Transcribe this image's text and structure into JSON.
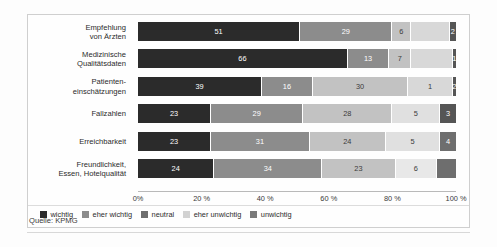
{
  "cropped_heading": "",
  "source": "Quelle: KPMG",
  "axis": {
    "ticks": [
      "0%",
      "20 %",
      "40 %",
      "60 %",
      "80 %",
      "100 %"
    ]
  },
  "legend": {
    "items": [
      {
        "label": "wichtig",
        "color": "#2b2b2b"
      },
      {
        "label": "eher wichtig",
        "color": "#8c8c8c"
      },
      {
        "label": "neutral",
        "color": "#6e6e6e"
      },
      {
        "label": "eher unwichtig",
        "color": "#d2d2d2"
      },
      {
        "label": "unwichtig",
        "color": "#7a7a7a"
      }
    ]
  },
  "chart_data": {
    "type": "bar",
    "orientation": "horizontal",
    "stacked": true,
    "normalized_percent": true,
    "title": "",
    "xlabel": "",
    "ylabel": "",
    "xlim": [
      0,
      100
    ],
    "grid": false,
    "legend_position": "bottom-left",
    "categories": [
      [
        "Empfehlung",
        "von Ärzten"
      ],
      [
        "Medizinische",
        "Qualitätsdaten"
      ],
      [
        "Patienten-",
        "einschätzungen"
      ],
      [
        "Fallzahlen"
      ],
      [
        "Erreichbarkeit"
      ],
      [
        "Freundlichkeit,",
        "Essen, Hotelqualität"
      ]
    ],
    "series": [
      {
        "name": "wichtig",
        "color": "#2b2b2b",
        "values": [
          51,
          66,
          39,
          23,
          23,
          24
        ]
      },
      {
        "name": "eher wichtig",
        "color": "#8c8c8c",
        "values": [
          29,
          13,
          16,
          29,
          31,
          34
        ]
      },
      {
        "name": "neutral",
        "color": "#6e6e6e",
        "values": [
          6,
          7,
          30,
          28,
          24,
          23
        ]
      },
      {
        "name": "eher unwichtig",
        "color": "#d2d2d2",
        "values": [
          12,
          13,
          14,
          15,
          17,
          18
        ]
      },
      {
        "name": "unwichtig",
        "color": "#7a7a7a",
        "values": [
          2,
          1,
          1,
          5,
          5,
          6
        ]
      }
    ],
    "rows": [
      {
        "category": [
          "Empfehlung",
          "von Ärzten"
        ],
        "segments": [
          {
            "series": "wichtig",
            "value": 51,
            "label": "51",
            "color": "#2b2b2b",
            "label_visible": true
          },
          {
            "series": "eher wichtig",
            "value": 29,
            "label": "29",
            "color": "#8c8c8c",
            "label_visible": true
          },
          {
            "series": "neutral",
            "value": 6,
            "label": "6",
            "color": "#c2c2c2",
            "label_visible": true
          },
          {
            "series": "eher unwichtig",
            "value": 12,
            "label": "12",
            "color": "#d8d8d8",
            "label_visible": false
          },
          {
            "series": "unwichtig",
            "value": 2,
            "label": "2",
            "color": "#555555",
            "label_visible": true
          }
        ]
      },
      {
        "category": [
          "Medizinische",
          "Qualitätsdaten"
        ],
        "segments": [
          {
            "series": "wichtig",
            "value": 66,
            "label": "66",
            "color": "#2b2b2b",
            "label_visible": true
          },
          {
            "series": "eher wichtig",
            "value": 13,
            "label": "13",
            "color": "#8c8c8c",
            "label_visible": true
          },
          {
            "series": "neutral",
            "value": 7,
            "label": "7",
            "color": "#c2c2c2",
            "label_visible": true
          },
          {
            "series": "eher unwichtig",
            "value": 13,
            "label": "13",
            "color": "#d8d8d8",
            "label_visible": false
          },
          {
            "series": "unwichtig",
            "value": 1,
            "label": "1",
            "color": "#555555",
            "label_visible": true
          }
        ]
      },
      {
        "category": [
          "Patienten-",
          "einschätzungen"
        ],
        "segments": [
          {
            "series": "wichtig",
            "value": 39,
            "label": "39",
            "color": "#2b2b2b",
            "label_visible": true
          },
          {
            "series": "eher wichtig",
            "value": 16,
            "label": "16",
            "color": "#8c8c8c",
            "label_visible": true
          },
          {
            "series": "neutral",
            "value": 30,
            "label": "30",
            "color": "#c2c2c2",
            "label_visible": true
          },
          {
            "series": "eher unwichtig",
            "value": 14,
            "label": "1",
            "color": "#d8d8d8",
            "label_visible": true
          },
          {
            "series": "unwichtig",
            "value": 1,
            "label": "2",
            "color": "#555555",
            "label_visible": true
          }
        ]
      },
      {
        "category": [
          "Fallzahlen"
        ],
        "segments": [
          {
            "series": "wichtig",
            "value": 23,
            "label": "23",
            "color": "#2b2b2b",
            "label_visible": true
          },
          {
            "series": "eher wichtig",
            "value": 29,
            "label": "29",
            "color": "#8c8c8c",
            "label_visible": true
          },
          {
            "series": "neutral",
            "value": 28,
            "label": "28",
            "color": "#c2c2c2",
            "label_visible": true
          },
          {
            "series": "eher unwichtig",
            "value": 15,
            "label": "5",
            "color": "#e0e0e0",
            "label_visible": true
          },
          {
            "series": "unwichtig",
            "value": 5,
            "label": "3",
            "color": "#555555",
            "label_visible": true
          }
        ]
      },
      {
        "category": [
          "Erreichbarkeit"
        ],
        "segments": [
          {
            "series": "wichtig",
            "value": 23,
            "label": "23",
            "color": "#2b2b2b",
            "label_visible": true
          },
          {
            "series": "eher wichtig",
            "value": 31,
            "label": "31",
            "color": "#8c8c8c",
            "label_visible": true
          },
          {
            "series": "neutral",
            "value": 24,
            "label": "24",
            "color": "#c2c2c2",
            "label_visible": true
          },
          {
            "series": "eher unwichtig",
            "value": 17,
            "label": "5",
            "color": "#e0e0e0",
            "label_visible": true
          },
          {
            "series": "unwichtig",
            "value": 5,
            "label": "4",
            "color": "#6e6e6e",
            "label_visible": true
          }
        ]
      },
      {
        "category": [
          "Freundlichkeit,",
          "Essen, Hotelqualität"
        ],
        "segments": [
          {
            "series": "wichtig",
            "value": 24,
            "label": "24",
            "color": "#2b2b2b",
            "label_visible": true
          },
          {
            "series": "eher wichtig",
            "value": 34,
            "label": "34",
            "color": "#8c8c8c",
            "label_visible": true
          },
          {
            "series": "neutral",
            "value": 23,
            "label": "23",
            "color": "#c2c2c2",
            "label_visible": true
          },
          {
            "series": "eher unwichtig",
            "value": 13,
            "label": "6",
            "color": "#e8e8e8",
            "label_visible": true
          },
          {
            "series": "unwichtig",
            "value": 6,
            "label": "",
            "color": "#6e6e6e",
            "label_visible": false
          }
        ]
      }
    ]
  }
}
